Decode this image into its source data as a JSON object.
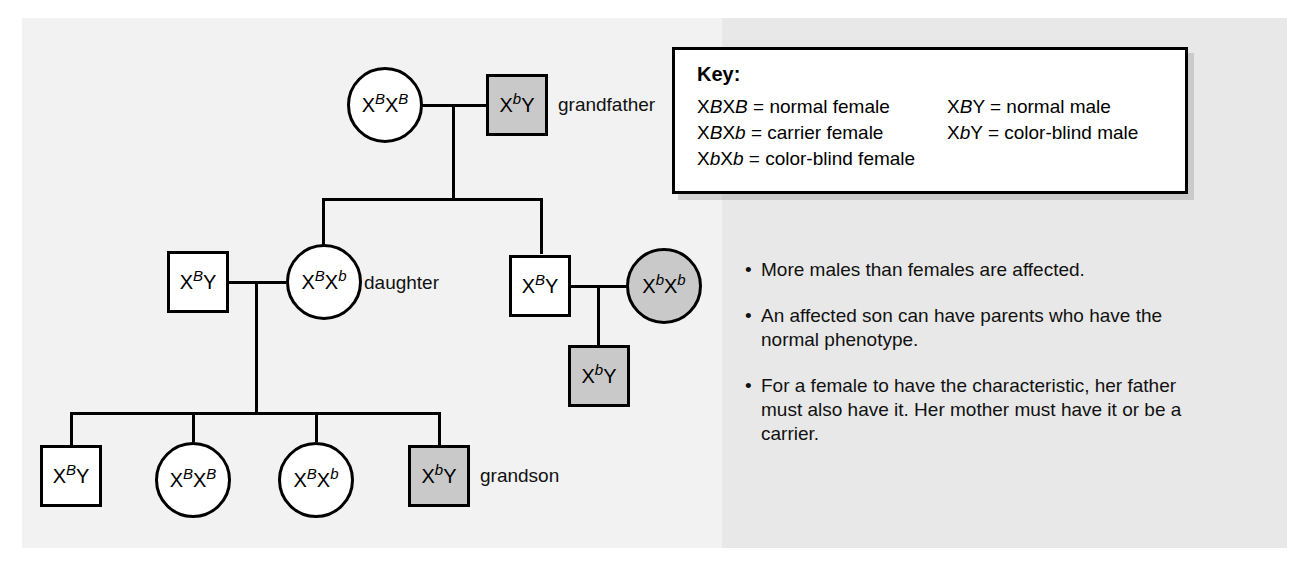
{
  "figure": {
    "type": "pedigree-chart",
    "topic": "X-linked recessive color blindness inheritance"
  },
  "colors": {
    "page_background": "#f2f2f2",
    "panel_background": "#e8e8e8",
    "affected_fill": "#c9c9c9",
    "unaffected_fill": "#ffffff",
    "stroke": "#000000"
  },
  "key": {
    "title": "Key:",
    "left_column": [
      {
        "genotype_base": "X",
        "genotype": "XBXB",
        "text": "= normal female"
      },
      {
        "genotype": "XBXb",
        "text": "= carrier female"
      },
      {
        "genotype": "XbXb",
        "text": "= color-blind female"
      }
    ],
    "right_column": [
      {
        "genotype": "XBY",
        "text": "= normal male"
      },
      {
        "genotype": "XbY",
        "text": "= color-blind male"
      }
    ],
    "entries": [
      {
        "sup1": "B",
        "sup2": "B",
        "desc": "normal female"
      },
      {
        "sup1": "B",
        "sup2": "b",
        "desc": "carrier female"
      },
      {
        "sup1": "b",
        "sup2": "b",
        "desc": "color-blind female"
      },
      {
        "sup1": "B",
        "sup2": "",
        "desc": "normal male"
      },
      {
        "sup1": "b",
        "sup2": "",
        "desc": "color-blind male"
      }
    ]
  },
  "individuals": {
    "g1_grandmother": {
      "shape": "circle",
      "affected": false,
      "allele1_sup": "B",
      "allele2_sup": "B",
      "second_symbol": "X",
      "label": ""
    },
    "g1_grandfather": {
      "shape": "square",
      "affected": true,
      "allele1_sup": "b",
      "allele2_sup": "",
      "second_symbol": "Y",
      "label": "grandfather"
    },
    "g2_son_in_law": {
      "shape": "square",
      "affected": false,
      "allele1_sup": "B",
      "allele2_sup": "",
      "second_symbol": "Y",
      "label": ""
    },
    "g2_daughter": {
      "shape": "circle",
      "affected": false,
      "allele1_sup": "B",
      "allele2_sup": "b",
      "second_symbol": "X",
      "label": "daughter"
    },
    "g2_son": {
      "shape": "square",
      "affected": false,
      "allele1_sup": "B",
      "allele2_sup": "",
      "second_symbol": "Y",
      "label": ""
    },
    "g2_daughter_in_law": {
      "shape": "circle",
      "affected": true,
      "allele1_sup": "b",
      "allele2_sup": "b",
      "second_symbol": "X",
      "label": ""
    },
    "g3_child_right": {
      "shape": "square",
      "affected": true,
      "allele1_sup": "b",
      "allele2_sup": "",
      "second_symbol": "Y",
      "label": ""
    },
    "g3_child1": {
      "shape": "square",
      "affected": false,
      "allele1_sup": "B",
      "allele2_sup": "",
      "second_symbol": "Y",
      "label": ""
    },
    "g3_child2": {
      "shape": "circle",
      "affected": false,
      "allele1_sup": "B",
      "allele2_sup": "B",
      "second_symbol": "X",
      "label": ""
    },
    "g3_child3": {
      "shape": "circle",
      "affected": false,
      "allele1_sup": "B",
      "allele2_sup": "b",
      "second_symbol": "X",
      "label": ""
    },
    "g3_child4": {
      "shape": "square",
      "affected": true,
      "allele1_sup": "b",
      "allele2_sup": "",
      "second_symbol": "Y",
      "label": "grandson"
    }
  },
  "labels": {
    "grandfather": "grandfather",
    "daughter": "daughter",
    "grandson": "grandson"
  },
  "notes": {
    "bullet_glyph": "•",
    "items": [
      "More males than females are affected.",
      "An affected son can have parents who have the normal phenotype.",
      "For a female to have the characteristic, her father must also have it. Her mother must have it or be a carrier."
    ]
  }
}
